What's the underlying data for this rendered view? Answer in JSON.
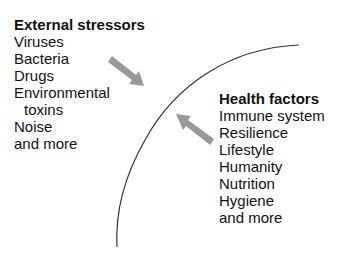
{
  "external": {
    "title": "External stressors",
    "items": [
      "Viruses",
      "Bacteria",
      "Drugs",
      "Environmental",
      "toxins",
      "Noise",
      "and more"
    ]
  },
  "health": {
    "title": "Health factors",
    "items": [
      "Immune system",
      "Resilience",
      "Lifestyle",
      "Humanity",
      "Nutrition",
      "Hygiene",
      "and more"
    ]
  },
  "colors": {
    "arrow": "#999999",
    "arc": "#333333",
    "text": "#111111"
  },
  "arrows": [
    {
      "name": "stressor-arrow",
      "direction": "inward"
    },
    {
      "name": "health-arrow",
      "direction": "outward"
    }
  ]
}
